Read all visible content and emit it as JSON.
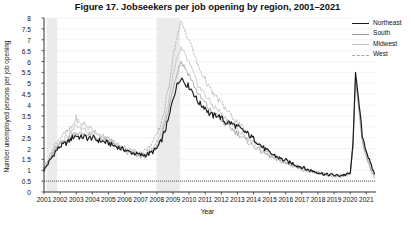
{
  "title": "Figure 17.  Jobseekers per job opening by region, 2001–2021",
  "axes": {
    "xlabel": "Year",
    "ylabel": "Number unemployed persons per job opening",
    "yticks": [
      "0",
      "0.5",
      "1",
      "1.5",
      "2",
      "2.5",
      "3",
      "3.5",
      "4",
      "4.5",
      "5",
      "5.5",
      "6",
      "6.5",
      "7",
      "7.5",
      "8"
    ],
    "xticks": [
      "2001",
      "2002",
      "2003",
      "2004",
      "2005",
      "2006",
      "2007",
      "2008",
      "2009",
      "2010",
      "2011",
      "2012",
      "2013",
      "2014",
      "2015",
      "2016",
      "2017",
      "2018",
      "2019",
      "2020",
      "2021"
    ]
  },
  "legend": {
    "items": [
      {
        "label": "Northeast",
        "color": "#1a1a1a",
        "width": 1.5,
        "dash": "none"
      },
      {
        "label": "South",
        "color": "#9a9a9a",
        "width": 1.0,
        "dash": "none"
      },
      {
        "label": "Midwest",
        "color": "#bdbdbd",
        "width": 1.0,
        "dash": "none"
      },
      {
        "label": "West",
        "color": "#a8a8a8",
        "width": 1.0,
        "dash": "2,1.6"
      }
    ]
  },
  "colors": {
    "recession_band": "#ebebeb",
    "gridline": "#e8e8e8",
    "axis": "#333333",
    "reference_line": "#222222"
  },
  "chart_data": {
    "type": "line",
    "title": "Figure 17.  Jobseekers per job opening by region, 2001–2021",
    "xlabel": "Year",
    "ylabel": "Number unemployed persons per job opening",
    "xlim": [
      2001,
      2021.6
    ],
    "ylim": [
      0,
      8
    ],
    "ytick_step": 0.5,
    "grid": true,
    "legend_position": "top-right-outside",
    "reference_lines": [
      {
        "y": 0.5,
        "style": "dotted",
        "label": ""
      }
    ],
    "shaded_regions": [
      {
        "name": "2001 recession",
        "x0": 2001.17,
        "x1": 2001.83
      },
      {
        "name": "2008-2009 recession",
        "x0": 2007.98,
        "x1": 2009.45
      }
    ],
    "x": [
      2001.0,
      2001.25,
      2001.5,
      2001.75,
      2002.0,
      2002.25,
      2002.5,
      2002.75,
      2003.0,
      2003.25,
      2003.5,
      2003.75,
      2004.0,
      2004.25,
      2004.5,
      2004.75,
      2005.0,
      2005.25,
      2005.5,
      2005.75,
      2006.0,
      2006.25,
      2006.5,
      2006.75,
      2007.0,
      2007.25,
      2007.5,
      2007.75,
      2008.0,
      2008.25,
      2008.5,
      2008.75,
      2009.0,
      2009.25,
      2009.5,
      2009.75,
      2010.0,
      2010.25,
      2010.5,
      2010.75,
      2011.0,
      2011.25,
      2011.5,
      2011.75,
      2012.0,
      2012.25,
      2012.5,
      2012.75,
      2013.0,
      2013.25,
      2013.5,
      2013.75,
      2014.0,
      2014.25,
      2014.5,
      2014.75,
      2015.0,
      2015.25,
      2015.5,
      2015.75,
      2016.0,
      2016.25,
      2016.5,
      2016.75,
      2017.0,
      2017.25,
      2017.5,
      2017.75,
      2018.0,
      2018.25,
      2018.5,
      2018.75,
      2019.0,
      2019.25,
      2019.5,
      2019.75,
      2020.0,
      2020.17,
      2020.33,
      2020.5,
      2020.75,
      2021.0,
      2021.25,
      2021.5
    ],
    "series": [
      {
        "name": "Northeast",
        "color": "#1a1a1a",
        "dash": "none",
        "values": [
          1.0,
          1.3,
          1.6,
          1.9,
          2.1,
          2.2,
          2.3,
          2.5,
          2.6,
          2.5,
          2.55,
          2.45,
          2.5,
          2.4,
          2.35,
          2.3,
          2.25,
          2.15,
          2.1,
          2.0,
          1.95,
          1.85,
          1.8,
          1.75,
          1.7,
          1.7,
          1.75,
          1.85,
          2.0,
          2.3,
          2.8,
          3.4,
          4.3,
          4.9,
          5.3,
          5.0,
          4.85,
          4.6,
          4.2,
          4.0,
          3.9,
          3.6,
          3.5,
          3.55,
          3.4,
          3.2,
          3.2,
          3.1,
          3.0,
          2.85,
          2.75,
          2.6,
          2.45,
          2.3,
          2.1,
          1.95,
          1.8,
          1.7,
          1.6,
          1.5,
          1.45,
          1.35,
          1.3,
          1.2,
          1.15,
          1.05,
          1.0,
          0.95,
          0.9,
          0.85,
          0.8,
          0.8,
          0.78,
          0.75,
          0.78,
          0.8,
          0.85,
          2.2,
          5.5,
          4.4,
          2.6,
          1.9,
          1.3,
          0.85
        ]
      },
      {
        "name": "South",
        "color": "#9a9a9a",
        "dash": "none",
        "values": [
          1.05,
          1.35,
          1.7,
          2.0,
          2.2,
          2.35,
          2.45,
          2.6,
          2.75,
          2.65,
          2.7,
          2.6,
          2.6,
          2.5,
          2.4,
          2.35,
          2.3,
          2.2,
          2.1,
          2.0,
          1.9,
          1.8,
          1.75,
          1.7,
          1.65,
          1.65,
          1.75,
          1.9,
          2.1,
          2.5,
          3.1,
          3.8,
          4.8,
          5.5,
          6.0,
          5.7,
          5.4,
          5.0,
          4.6,
          4.3,
          4.1,
          3.8,
          3.6,
          3.5,
          3.3,
          3.1,
          3.0,
          2.85,
          2.7,
          2.55,
          2.4,
          2.25,
          2.1,
          2.0,
          1.85,
          1.75,
          1.65,
          1.55,
          1.45,
          1.4,
          1.3,
          1.25,
          1.2,
          1.1,
          1.05,
          1.0,
          0.95,
          0.9,
          0.85,
          0.8,
          0.78,
          0.75,
          0.72,
          0.7,
          0.72,
          0.75,
          0.8,
          2.0,
          5.1,
          4.0,
          2.3,
          1.6,
          1.1,
          0.7
        ]
      },
      {
        "name": "Midwest",
        "color": "#bdbdbd",
        "dash": "none",
        "values": [
          1.1,
          1.4,
          1.75,
          2.1,
          2.35,
          2.5,
          2.6,
          2.8,
          3.1,
          2.9,
          2.95,
          2.8,
          2.8,
          2.65,
          2.55,
          2.45,
          2.4,
          2.3,
          2.2,
          2.1,
          2.0,
          1.9,
          1.85,
          1.8,
          1.75,
          1.8,
          1.9,
          2.05,
          2.3,
          2.7,
          3.4,
          4.2,
          5.3,
          6.1,
          6.6,
          6.3,
          5.9,
          5.5,
          5.0,
          4.7,
          4.5,
          4.2,
          3.95,
          3.8,
          3.6,
          3.4,
          3.25,
          3.05,
          2.9,
          2.7,
          2.55,
          2.4,
          2.25,
          2.1,
          1.95,
          1.85,
          1.7,
          1.6,
          1.5,
          1.45,
          1.35,
          1.3,
          1.25,
          1.15,
          1.1,
          1.05,
          1.0,
          0.95,
          0.9,
          0.85,
          0.8,
          0.78,
          0.75,
          0.72,
          0.75,
          0.78,
          0.82,
          2.1,
          5.3,
          4.2,
          2.4,
          1.7,
          1.15,
          0.75
        ]
      },
      {
        "name": "West",
        "color": "#a8a8a8",
        "dash": "2,1.6",
        "values": [
          1.15,
          1.5,
          1.9,
          2.25,
          2.5,
          2.65,
          2.8,
          3.0,
          3.4,
          3.1,
          3.15,
          2.95,
          2.9,
          2.75,
          2.6,
          2.5,
          2.45,
          2.35,
          2.25,
          2.1,
          2.05,
          1.95,
          1.9,
          1.85,
          1.8,
          1.9,
          2.05,
          2.3,
          2.6,
          3.1,
          3.9,
          4.9,
          6.2,
          7.1,
          7.8,
          7.4,
          7.0,
          6.5,
          5.9,
          5.5,
          5.2,
          4.8,
          4.5,
          4.3,
          4.1,
          3.85,
          3.6,
          3.4,
          3.2,
          3.0,
          2.8,
          2.6,
          2.45,
          2.25,
          2.1,
          1.95,
          1.8,
          1.7,
          1.6,
          1.5,
          1.4,
          1.35,
          1.25,
          1.2,
          1.1,
          1.05,
          1.0,
          0.95,
          0.9,
          0.85,
          0.82,
          0.78,
          0.75,
          0.75,
          0.78,
          0.8,
          0.85,
          2.3,
          5.4,
          4.3,
          2.5,
          1.75,
          1.2,
          0.78
        ]
      }
    ]
  }
}
